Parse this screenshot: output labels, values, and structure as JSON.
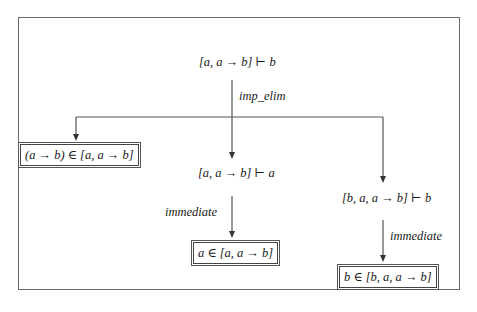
{
  "diagram": {
    "type": "proof-tree",
    "root": {
      "sequent": "[a,  a → b] ⊢ b",
      "rule": "imp_elim"
    },
    "children": [
      {
        "id": "left",
        "leaf": "(a → b) ∈ [a, a → b]",
        "boxed": true
      },
      {
        "id": "middle",
        "sequent": "[a, a → b] ⊢ a",
        "rule": "immediate",
        "leaf": "a ∈ [a, a → b]"
      },
      {
        "id": "right",
        "sequent": "[b, a, a → b] ⊢ b",
        "rule": "immediate",
        "leaf": "b ∈ [b, a, a → b]"
      }
    ],
    "colors": {
      "line": "#555555",
      "frame": "#6a6a6a",
      "text": "#1a1a1a",
      "background": "#ffffff"
    }
  }
}
